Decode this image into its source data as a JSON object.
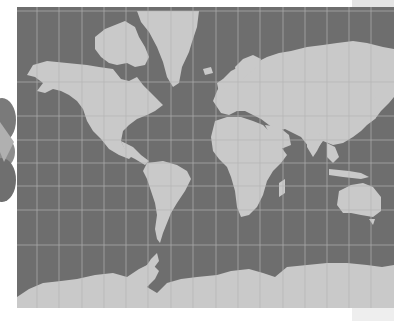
{
  "map": {
    "projection": "mercator",
    "style": "grayscale world map with graticule",
    "colors": {
      "ocean": "#6e6e6e",
      "land": "#c9c9c9",
      "graticule": "#b4b4b4",
      "background": "#ffffff"
    },
    "graticule": {
      "meridians_px": [
        20,
        42,
        65,
        87,
        109,
        131,
        154,
        176,
        199,
        221,
        243,
        266,
        288,
        310,
        332,
        354
      ],
      "parallels_px": [
        4,
        75,
        109,
        133,
        156,
        179,
        203,
        238
      ]
    },
    "regions": [
      "North America",
      "Greenland",
      "South America",
      "Europe",
      "Africa",
      "Asia",
      "Australia",
      "Antarctica",
      "Madagascar",
      "Japan",
      "Arctic Islands"
    ]
  }
}
